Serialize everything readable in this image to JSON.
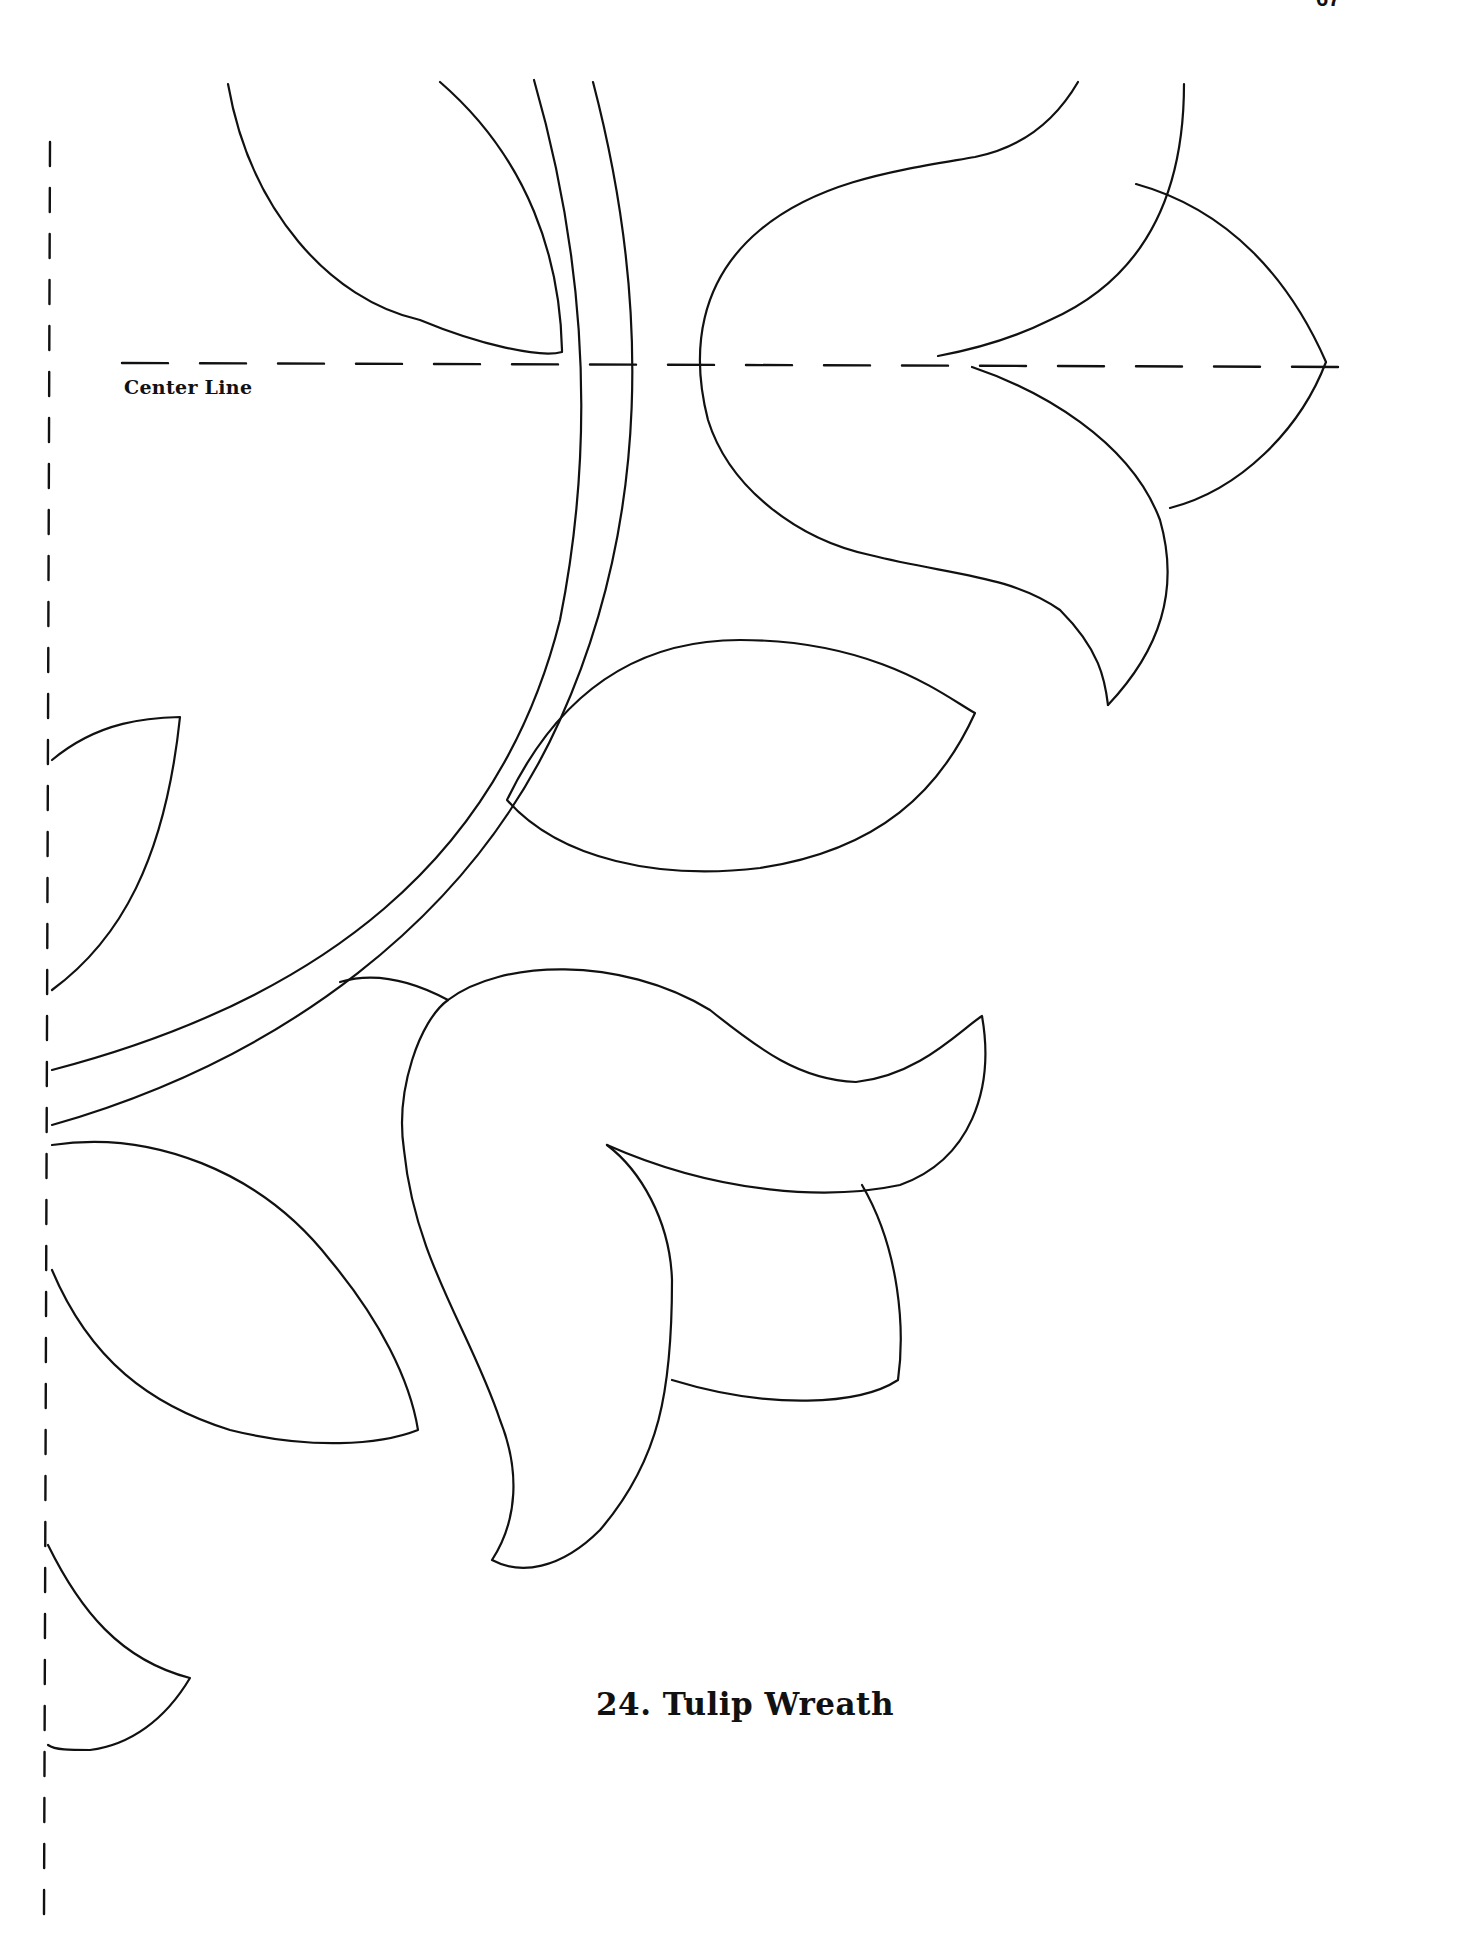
{
  "page": {
    "page_number": "67",
    "background": "#ffffff",
    "ink_color": "#111111"
  },
  "pattern": {
    "center_line_label": "Center Line",
    "title": "24. Tulip Wreath"
  }
}
